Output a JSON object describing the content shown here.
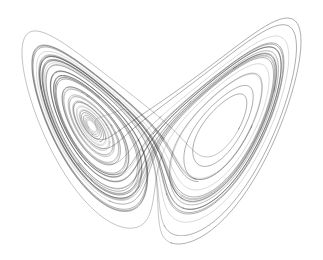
{
  "figure": {
    "background_color": "#ffffff",
    "line_color": "#2a2a2a",
    "width": 323,
    "height": 260
  },
  "chart_data": {
    "type": "line",
    "subtitle": "",
    "xlabel": "",
    "ylabel": "",
    "xlim": [
      -21,
      21
    ],
    "ylim": [
      0,
      50
    ],
    "grid": false,
    "legend": "none",
    "axes_visible": false,
    "tick_labels_x": [],
    "tick_labels_y": [],
    "annotations": [],
    "system": {
      "equations": [
        "dx/dt = sigma*(y - x)",
        "dy/dt = x*(rho - z) - y",
        "dz/dt = x*y - beta*z"
      ],
      "sigma": 10,
      "rho": 28,
      "beta": 2.6666666667,
      "initial_state": [
        0.8,
        1.4,
        1.6
      ],
      "dt": 0.0045,
      "steps": 11000,
      "projection": "x-z plane"
    },
    "series": [
      {
        "name": "trajectory",
        "description": "Single chaotic orbit projected on the x-z plane forming two lobes",
        "color": "#2a2a2a",
        "lobes": [
          {
            "name": "left-lobe",
            "center_fixed_point": [
              -8.72,
              27.0
            ],
            "pixel_center": [
              96,
              121
            ],
            "pixel_eye_size": [
              11,
              17
            ],
            "density": "high",
            "spiral_turns": 26
          },
          {
            "name": "right-lobe",
            "center_fixed_point": [
              8.72,
              27.0
            ],
            "pixel_center": [
              225,
              118
            ],
            "pixel_eye_size": [
              58,
              86
            ],
            "density": "medium",
            "spiral_turns": 20
          }
        ],
        "crossover_pixel_region": [
          165,
          130,
          30,
          40
        ]
      }
    ]
  }
}
